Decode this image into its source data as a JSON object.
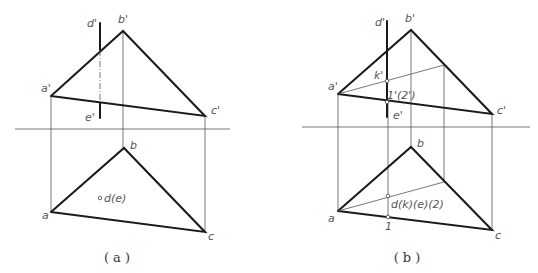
{
  "figure_a": {
    "caption": "( a )",
    "labels": {
      "d_prime": "d'",
      "b_prime": "b'",
      "a_prime": "a'",
      "c_prime": "c'",
      "e_prime": "e'",
      "b": "b",
      "a": "a",
      "c": "c",
      "de": "d(e)"
    }
  },
  "figure_b": {
    "caption": "( b )",
    "labels": {
      "d_prime": "d'",
      "b_prime": "b'",
      "a_prime": "a'",
      "c_prime": "c'",
      "e_prime": "e'",
      "k_prime": "k'",
      "one_two_prime": "1'(2')",
      "b": "b",
      "a": "a",
      "c": "c",
      "dkee2": "d(k)(e)(2)",
      "one": "1"
    }
  },
  "colors": {
    "thick_line": "#1a1a1a",
    "thin_line": "#555555",
    "label": "#555555"
  }
}
